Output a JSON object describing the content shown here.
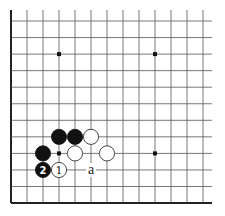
{
  "board": {
    "columns": 13,
    "rows": 12,
    "origin_x": 11,
    "origin_y": 21,
    "spacing_x": 16,
    "spacing_y": 16.55,
    "right_extent": 212,
    "top_extent": 10,
    "edges": [
      "left",
      "bottom"
    ],
    "colors": {
      "line": "#555555",
      "edge": "#222222",
      "black": "#111111",
      "white": "#ffffff"
    }
  },
  "star_points": [
    {
      "col": 3,
      "row": 2
    },
    {
      "col": 9,
      "row": 2
    },
    {
      "col": 3,
      "row": 8
    },
    {
      "col": 9,
      "row": 8
    }
  ],
  "stones": [
    {
      "color": "black",
      "col": 3,
      "row": 7,
      "label": ""
    },
    {
      "color": "black",
      "col": 4,
      "row": 7,
      "label": ""
    },
    {
      "color": "white",
      "col": 5,
      "row": 7,
      "label": ""
    },
    {
      "color": "black",
      "col": 2,
      "row": 8,
      "label": ""
    },
    {
      "color": "white",
      "col": 4,
      "row": 8,
      "label": ""
    },
    {
      "color": "white",
      "col": 6,
      "row": 8,
      "label": ""
    },
    {
      "color": "black",
      "col": 2,
      "row": 9,
      "label": "2"
    },
    {
      "color": "white",
      "col": 3,
      "row": 9,
      "label": "1"
    }
  ],
  "labels": [
    {
      "text": "a",
      "col": 5,
      "row": 9
    }
  ]
}
